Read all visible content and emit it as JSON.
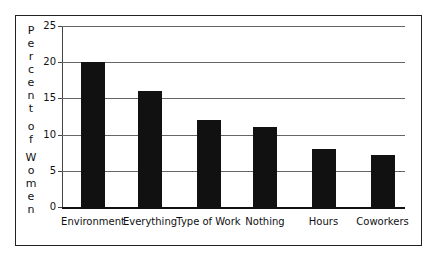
{
  "chart_data": {
    "type": "bar",
    "title": "",
    "xlabel": "",
    "ylabel": "Percent of Women",
    "categories": [
      "Environment",
      "Everything",
      "Type of Work",
      "Nothing",
      "Hours",
      "Coworkers"
    ],
    "values": [
      20,
      16,
      12,
      11,
      8,
      7.2
    ],
    "ylim": [
      0,
      25
    ],
    "yticks": [
      0,
      5,
      10,
      15,
      20,
      25
    ],
    "grid": true,
    "legend": null,
    "bar_color": "#111111"
  },
  "axis": {
    "ylabel_letters": [
      "P",
      "e",
      "r",
      "c",
      "e",
      "n",
      "t",
      "",
      "o",
      "f",
      "",
      "W",
      "o",
      "m",
      "e",
      "n"
    ],
    "ytick_labels": [
      "25",
      "20",
      "15",
      "10",
      "5",
      "0"
    ]
  }
}
